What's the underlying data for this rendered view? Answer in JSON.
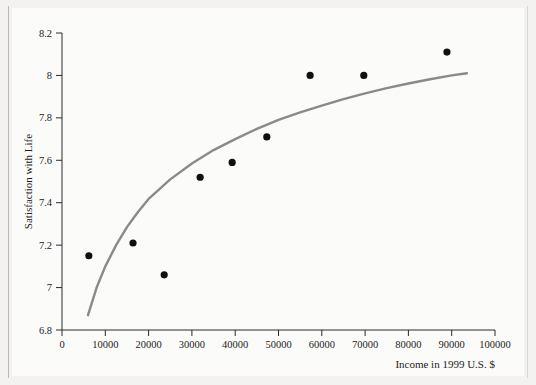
{
  "chart_data": {
    "type": "scatter",
    "title": "",
    "subtitle": "",
    "xlabel": "Income in 1999 U.S. $",
    "ylabel": "Satisfaction with Life",
    "xlim": [
      0,
      100000
    ],
    "ylim": [
      6.8,
      8.2
    ],
    "grid": false,
    "legend": "none",
    "xticks": [
      0,
      10000,
      20000,
      30000,
      40000,
      50000,
      60000,
      70000,
      80000,
      90000,
      100000
    ],
    "xtick_labels": [
      "0",
      "10000",
      "20000",
      "30000",
      "40000",
      "50000",
      "60000",
      "70000",
      "80000",
      "90000",
      "100000"
    ],
    "yticks": [
      6.8,
      7,
      7.2,
      7.4,
      7.6,
      7.8,
      8,
      8.2
    ],
    "ytick_labels": [
      "6.8",
      "7",
      "7.2",
      "7.4",
      "7.6",
      "7.8",
      "8",
      "8.2"
    ],
    "series": [
      {
        "name": "observations",
        "type": "scatter",
        "marker": "filled-circle",
        "color": "#101010",
        "marker_size": 5.0,
        "points": [
          {
            "x": 6200,
            "y": 7.15
          },
          {
            "x": 16400,
            "y": 7.21
          },
          {
            "x": 23600,
            "y": 7.06
          },
          {
            "x": 31900,
            "y": 7.52
          },
          {
            "x": 39300,
            "y": 7.59
          },
          {
            "x": 47300,
            "y": 7.71
          },
          {
            "x": 57300,
            "y": 8.0
          },
          {
            "x": 69700,
            "y": 8.0
          },
          {
            "x": 88900,
            "y": 8.11
          }
        ]
      },
      {
        "name": "logarithmic-trend-curve",
        "type": "line",
        "color": "#8a8a8a",
        "line_width": 2.4,
        "points": [
          {
            "x": 6000,
            "y": 6.87
          },
          {
            "x": 8000,
            "y": 7.0
          },
          {
            "x": 10000,
            "y": 7.1
          },
          {
            "x": 12500,
            "y": 7.2
          },
          {
            "x": 15000,
            "y": 7.285
          },
          {
            "x": 17500,
            "y": 7.355
          },
          {
            "x": 20000,
            "y": 7.418
          },
          {
            "x": 25000,
            "y": 7.51
          },
          {
            "x": 30000,
            "y": 7.585
          },
          {
            "x": 35000,
            "y": 7.648
          },
          {
            "x": 40000,
            "y": 7.7
          },
          {
            "x": 45000,
            "y": 7.748
          },
          {
            "x": 50000,
            "y": 7.79
          },
          {
            "x": 55000,
            "y": 7.826
          },
          {
            "x": 60000,
            "y": 7.858
          },
          {
            "x": 65000,
            "y": 7.888
          },
          {
            "x": 70000,
            "y": 7.915
          },
          {
            "x": 75000,
            "y": 7.94
          },
          {
            "x": 80000,
            "y": 7.962
          },
          {
            "x": 85000,
            "y": 7.982
          },
          {
            "x": 90000,
            "y": 8.0
          },
          {
            "x": 93500,
            "y": 8.01
          }
        ]
      }
    ],
    "colors": {
      "marker": "#101010",
      "trend_line": "#8a8a8a",
      "axis": "#2a2a2a",
      "plot_background": "#fbfbfa",
      "page_background": "#f3f2f0"
    }
  }
}
